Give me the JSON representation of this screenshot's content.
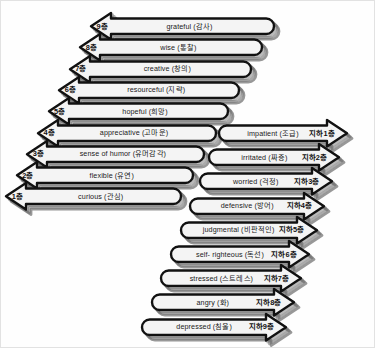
{
  "diagram": {
    "colors": {
      "outline": "#111111",
      "fill": "#f4f4f4",
      "shadow": "#6e6e6e",
      "background": "#fefefe",
      "border": "#e2e2e2",
      "text": "#1a1a1a"
    },
    "up_stack": {
      "name": "above-ground-floors",
      "direction": "left",
      "rows": [
        {
          "floor": "9층",
          "label": "grateful (감사)"
        },
        {
          "floor": "8층",
          "label": "wise (통찰)"
        },
        {
          "floor": "7층",
          "label": "creative (창의)"
        },
        {
          "floor": "6층",
          "label": "resourceful (지략)"
        },
        {
          "floor": "5층",
          "label": "hopeful (희망)"
        },
        {
          "floor": "4층",
          "label": "appreciative (고마운)"
        },
        {
          "floor": "3층",
          "label": "sense of humor (유머감각)"
        },
        {
          "floor": "2층",
          "label": "flexible (유연)"
        },
        {
          "floor": "1층",
          "label": "curious (관심)"
        }
      ]
    },
    "down_stack": {
      "name": "basement-floors",
      "direction": "right",
      "rows": [
        {
          "floor": "지하1층",
          "label": "impatient (조급)"
        },
        {
          "floor": "지하2층",
          "label": "irritated (짜증)"
        },
        {
          "floor": "지하3층",
          "label": "worried (걱정)"
        },
        {
          "floor": "지하4층",
          "label": "defensive (방어)"
        },
        {
          "floor": "지하5층",
          "label": "judgmental (비판적인)"
        },
        {
          "floor": "지하6층",
          "label": "self- righteous (독선)"
        },
        {
          "floor": "지하7층",
          "label": "stressed (스트레스)"
        },
        {
          "floor": "지하8층",
          "label": "angry (화)"
        },
        {
          "floor": "지하9층",
          "label": "depressed (침울)"
        }
      ]
    }
  }
}
